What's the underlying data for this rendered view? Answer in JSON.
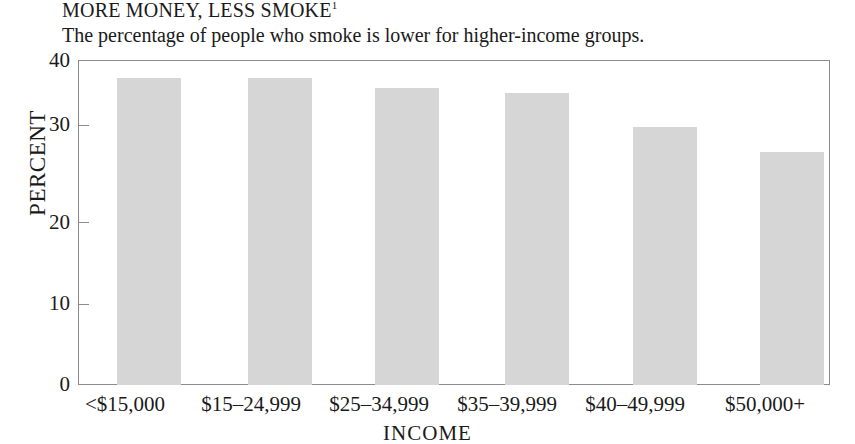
{
  "chart_data": {
    "type": "bar",
    "title": "MORE MONEY, LESS SMOKE",
    "title_footnote_marker": "1",
    "subtitle": "The percentage of people who smoke is lower for higher-income groups.",
    "xlabel": "INCOME",
    "ylabel": "PERCENT",
    "categories": [
      "<$15,000",
      "$15–24,999",
      "$25–34,999",
      "$35–39,999",
      "$40–49,999",
      "$50,000+"
    ],
    "values": [
      37.8,
      37.8,
      36.6,
      35.9,
      31.7,
      28.7
    ],
    "ylim": [
      0,
      40
    ],
    "yticks": [
      0,
      10,
      20,
      30,
      40
    ],
    "ytick_labels": [
      "0",
      "10",
      "20",
      "30",
      "40"
    ],
    "grid": false,
    "legend": "none",
    "bar_color": "#d6d6d6",
    "frame_color": "#8c8c8c",
    "text_color": "#1a1a1a",
    "background": "#ffffff"
  }
}
